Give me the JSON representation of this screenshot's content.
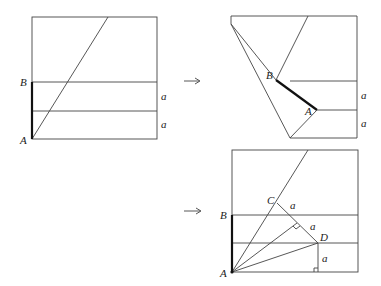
{
  "figure": {
    "panel1": {
      "labels": {
        "B": "B",
        "A": "A",
        "a1": "a",
        "a2": "a"
      }
    },
    "arrow1": {
      "glyph": "→"
    },
    "panel2": {
      "labels": {
        "B": "B",
        "A": "A",
        "a1": "a",
        "a2": "a"
      }
    },
    "arrow2": {
      "glyph": "→"
    },
    "panel3": {
      "labels": {
        "B": "B",
        "A": "A",
        "C": "C",
        "D": "D",
        "a1": "a",
        "a2": "a",
        "a3": "a"
      }
    },
    "colors": {
      "line": "#444444",
      "bold_line": "#111111",
      "background": "#ffffff"
    }
  }
}
